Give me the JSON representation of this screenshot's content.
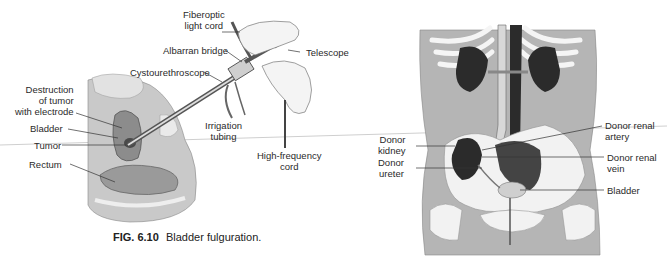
{
  "figure_left": {
    "caption_number": "FIG. 6.10",
    "caption_text": "Bladder fulguration.",
    "labels": {
      "fiberoptic": "Fiberoptic\nlight cord",
      "albarran": "Albarran bridge",
      "telescope": "Telescope",
      "cystourethroscope": "Cystourethroscope",
      "destruction": "Destruction\nof tumor\nwith electrode",
      "bladder": "Bladder",
      "tumor": "Tumor",
      "rectum": "Rectum",
      "irrigation": "Irrigation\ntubing",
      "highfreq": "High-frequency\ncord"
    }
  },
  "figure_right": {
    "labels": {
      "donor_kidney": "Donor\nkidney",
      "donor_ureter": "Donor\nureter",
      "renal_artery": "Donor renal\nartery",
      "renal_vein": "Donor renal\nvein",
      "bladder": "Bladder"
    }
  },
  "colors": {
    "skin": "#b8b8b8",
    "bone": "#f2f2f2",
    "organ_dark": "#2b2b2b",
    "line": "#333333"
  }
}
